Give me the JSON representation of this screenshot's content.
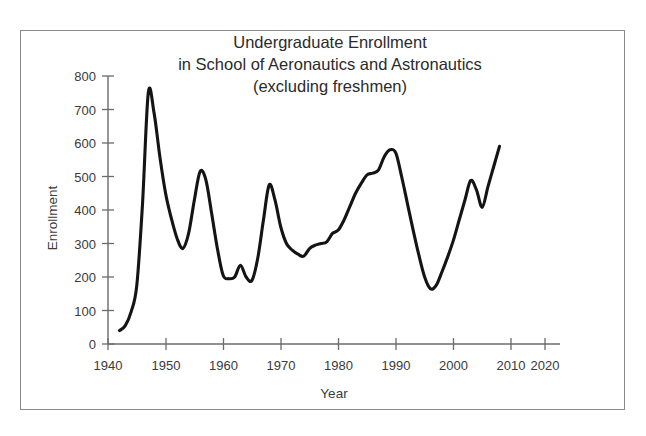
{
  "figure": {
    "border_color": "#8a8a8a",
    "background": "#ffffff"
  },
  "chart_data": {
    "type": "line",
    "title": "Undergraduate Enrollment\nin School of Aeronautics and Astronautics\n(excluding freshmen)",
    "title_lines": [
      "Undergraduate Enrollment",
      "in School of Aeronautics and Astronautics",
      "(excluding freshmen)"
    ],
    "xlabel": "Year",
    "ylabel": "Enrollment",
    "xlim": [
      1940,
      2022
    ],
    "ylim": [
      0,
      800
    ],
    "xticks": [
      1940,
      1950,
      1960,
      1970,
      1980,
      1990,
      2000,
      2010,
      2020
    ],
    "xticklabels": [
      "1940",
      "1950",
      "1960",
      "1970",
      "1980",
      "1990",
      "2000",
      "2010",
      "2020"
    ],
    "yticks": [
      0,
      100,
      200,
      300,
      400,
      500,
      600,
      700,
      800
    ],
    "yticklabels": [
      "0",
      "100",
      "200",
      "300",
      "400",
      "500",
      "600",
      "700",
      "800"
    ],
    "grid": false,
    "legend": false,
    "line_color": "#141414",
    "series": [
      {
        "name": "Undergraduate Enrollment",
        "x": [
          1942,
          1943,
          1944,
          1945,
          1946,
          1947,
          1948,
          1949,
          1950,
          1951,
          1952,
          1953,
          1954,
          1955,
          1956,
          1957,
          1958,
          1959,
          1960,
          1961,
          1962,
          1963,
          1964,
          1965,
          1966,
          1967,
          1968,
          1969,
          1970,
          1971,
          1972,
          1973,
          1974,
          1975,
          1976,
          1977,
          1978,
          1979,
          1980,
          1981,
          1982,
          1983,
          1984,
          1985,
          1986,
          1987,
          1988,
          1989,
          1990,
          1991,
          1992,
          1993,
          1994,
          1995,
          1996,
          1997,
          1998,
          1999,
          2000,
          2001,
          2002,
          2003,
          2004,
          2005,
          2006,
          2007,
          2008
        ],
        "values": [
          40,
          55,
          95,
          175,
          420,
          750,
          690,
          560,
          450,
          375,
          315,
          285,
          330,
          430,
          515,
          490,
          390,
          285,
          205,
          195,
          200,
          235,
          200,
          190,
          255,
          370,
          475,
          430,
          350,
          300,
          280,
          268,
          262,
          285,
          295,
          300,
          305,
          330,
          340,
          370,
          410,
          450,
          480,
          505,
          510,
          520,
          560,
          580,
          570,
          500,
          420,
          340,
          265,
          200,
          165,
          175,
          215,
          260,
          310,
          370,
          430,
          488,
          460,
          408,
          470,
          530,
          590
        ]
      }
    ]
  }
}
